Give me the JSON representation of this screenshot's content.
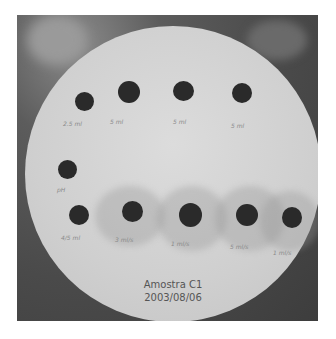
{
  "image": {
    "description": "Photograph of a circular agar/paper disc with dark sample spots and handwritten labels",
    "background_color": "#4a4a4a",
    "disc_color": "#d4d4d4",
    "spot_color": "#2a2a2a"
  },
  "top_row": {
    "labels": [
      "2.5 ml",
      "5 ml",
      "5 ml",
      "5 ml"
    ]
  },
  "middle_left": {
    "label": "pH"
  },
  "bottom_row": {
    "labels": [
      "4/5 ml",
      "3 ml/s",
      "1 ml/s",
      "5 ml/s",
      "1 ml/s"
    ]
  },
  "caption": {
    "line1": "Amostra C1",
    "line2": "2003/08/06"
  }
}
